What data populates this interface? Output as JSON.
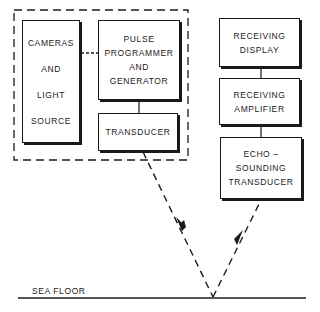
{
  "diagram": {
    "type": "block-diagram",
    "blocks": {
      "cameras": {
        "lines": [
          "CAMERAS",
          "AND",
          "LIGHT",
          "SOURCE"
        ]
      },
      "pulse": {
        "lines": [
          "PULSE",
          "PROGRAMMER",
          "AND",
          "GENERATOR"
        ]
      },
      "transducer": {
        "lines": [
          "TRANSDUCER"
        ]
      },
      "receiving_display": {
        "lines": [
          "RECEIVING",
          "DISPLAY"
        ]
      },
      "receiving_amplifier": {
        "lines": [
          "RECEIVING",
          "AMPLIFIER"
        ]
      },
      "echo_transducer": {
        "lines": [
          "ECHO –",
          "SOUNDING",
          "TRANSDUCER"
        ]
      }
    },
    "sea_floor_label": "SEA FLOOR",
    "connections": [
      {
        "from": "cameras",
        "to": "pulse",
        "style": "dashed"
      },
      {
        "from": "pulse",
        "to": "transducer",
        "style": "solid"
      },
      {
        "from": "receiving_display",
        "to": "receiving_amplifier",
        "style": "solid"
      },
      {
        "from": "receiving_amplifier",
        "to": "echo_transducer",
        "style": "solid"
      },
      {
        "from": "transducer",
        "to": "sea_floor",
        "style": "dashed-arrow"
      },
      {
        "from": "sea_floor",
        "to": "echo_transducer",
        "style": "dashed-arrow"
      }
    ],
    "group": {
      "members": [
        "cameras",
        "pulse",
        "transducer"
      ],
      "style": "dashed-border"
    }
  }
}
